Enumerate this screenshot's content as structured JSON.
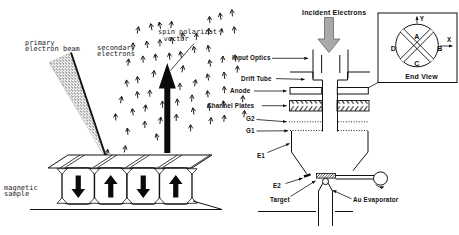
{
  "left": {
    "primary_1": "primary",
    "primary_2": "electron beam",
    "secondary_1": "secondary",
    "secondary_2": "electrons",
    "spin_1": "spin polarizat",
    "spin_2": "vector",
    "sample_1": "magnetic",
    "sample_2": "sample",
    "domain_arrows": [
      "down",
      "up",
      "down",
      "up"
    ]
  },
  "right": {
    "incident": "Incident Electrons",
    "input_optics": "Input Optics",
    "drift_tube": "Drift Tube",
    "anode": "Anode",
    "channel_plates": "Channel Plates",
    "g2": "G2",
    "g1": "G1",
    "e1": "E1",
    "e2": "E2",
    "target": "Target",
    "au_evaporator": "Au Evaporator"
  },
  "end_view": {
    "title": "End View",
    "a": "A",
    "b": "B",
    "c": "C",
    "d": "D",
    "x": "X",
    "y": "Y"
  },
  "colors": {
    "ink": "#111111",
    "incident_arrow_fill": "#a9a9a9",
    "background": "#ffffff"
  }
}
